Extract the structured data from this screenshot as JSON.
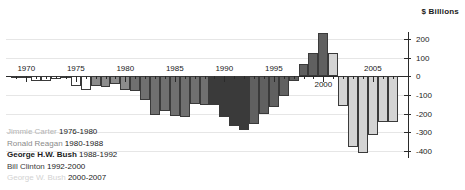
{
  "unit_label": "$ Billions",
  "legend": {
    "rows": [
      {
        "name": "Jimmie Carter ",
        "years": "1976-1980"
      },
      {
        "name": "Ronald Reagan ",
        "years": "1980-1988"
      },
      {
        "name": "George H.W. Bush ",
        "years": "1988-1992"
      },
      {
        "name": "Bill Clinton ",
        "years": "1992-2000"
      },
      {
        "name": "George W. Bush ",
        "years": "2000-2007"
      }
    ]
  },
  "colors": {
    "nixon_ford": "#ffffff",
    "carter": "#8c8c8c",
    "reagan": "#707070",
    "ghw_bush": "#3a3a3a",
    "clinton": "#606060",
    "gw_bush": "#d4d4d4",
    "axis": "#2a2a2a",
    "grid": "#e6e6e6"
  },
  "chart_data": {
    "type": "bar",
    "title": "",
    "subtitle": "",
    "xlabel": "",
    "ylabel": "$ Billions",
    "ylim": [
      -450,
      250
    ],
    "yticks": [
      200,
      100,
      0,
      -100,
      -200,
      -300,
      -400
    ],
    "ytick_labels": [
      "200",
      "100",
      "0",
      "-100",
      "-200",
      "-300",
      "-400"
    ],
    "xticks": [
      1970,
      1975,
      1980,
      1985,
      1990,
      1995,
      2000,
      2005
    ],
    "xtick_labels": [
      "1970",
      "1975",
      "1980",
      "1985",
      "1990",
      "1995",
      "2000",
      "2005"
    ],
    "grid": true,
    "legend_position": "lower-left",
    "series_name": "Federal budget surplus / deficit",
    "x": [
      1969,
      1970,
      1971,
      1972,
      1973,
      1974,
      1975,
      1976,
      1977,
      1978,
      1979,
      1980,
      1981,
      1982,
      1983,
      1984,
      1985,
      1986,
      1987,
      1988,
      1989,
      1990,
      1991,
      1992,
      1993,
      1994,
      1995,
      1996,
      1997,
      1998,
      1999,
      2000,
      2001,
      2002,
      2003,
      2004,
      2005,
      2006,
      2007
    ],
    "values": [
      3,
      -3,
      -23,
      -23,
      -15,
      -6,
      -53,
      -74,
      -54,
      -59,
      -41,
      -74,
      -79,
      -128,
      -208,
      -185,
      -212,
      -221,
      -150,
      -155,
      -153,
      -221,
      -269,
      -290,
      -255,
      -203,
      -164,
      -107,
      -22,
      69,
      126,
      236,
      128,
      -158,
      -378,
      -413,
      -318,
      -248,
      -245
    ],
    "groups": [
      {
        "label": "Nixon / Ford",
        "start": 1969,
        "end": 1976,
        "color": "#ffffff"
      },
      {
        "label": "Jimmie Carter 1976-1980",
        "start": 1977,
        "end": 1980,
        "color": "#8c8c8c"
      },
      {
        "label": "Ronald Reagan 1980-1988",
        "start": 1981,
        "end": 1988,
        "color": "#707070"
      },
      {
        "label": "George H.W. Bush 1988-1992",
        "start": 1989,
        "end": 1992,
        "color": "#3a3a3a"
      },
      {
        "label": "Bill Clinton 1992-2000",
        "start": 1993,
        "end": 2000,
        "color": "#606060"
      },
      {
        "label": "George W. Bush 2000-2007",
        "start": 2001,
        "end": 2007,
        "color": "#d4d4d4"
      }
    ]
  }
}
